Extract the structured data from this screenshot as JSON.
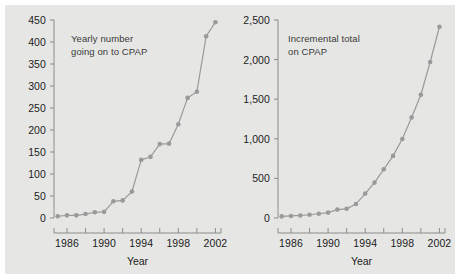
{
  "figure": {
    "background_color": "#e6e6e4",
    "border_color": "#ffffff",
    "series_color": "#9a9a9a",
    "axis_color": "#8c8c8c",
    "text_color": "#1c1c1c"
  },
  "chart_data": [
    {
      "type": "line",
      "title": "Yearly number\ngoing on to CPAP",
      "xlabel": "Year",
      "ylabel": "",
      "xlim": [
        1984.6,
        2002.6
      ],
      "ylim": [
        0,
        450
      ],
      "grid": false,
      "legend": "none",
      "marker": "circle",
      "ytick_labels": [
        "0",
        "50",
        "100",
        "150",
        "200",
        "250",
        "300",
        "350",
        "400",
        "450"
      ],
      "ytick_values": [
        0,
        50,
        100,
        150,
        200,
        250,
        300,
        350,
        400,
        450
      ],
      "xtick_values": [
        1986,
        1988,
        1990,
        1992,
        1994,
        1996,
        1998,
        2000,
        2002
      ],
      "xtick_labels": [
        "1986",
        "",
        "1990",
        "",
        "1994",
        "",
        "1998",
        "",
        "2002"
      ],
      "x": [
        1985,
        1986,
        1987,
        1988,
        1989,
        1990,
        1991,
        1992,
        1993,
        1994,
        1995,
        1996,
        1997,
        1998,
        1999,
        2000,
        2001,
        2002
      ],
      "values": [
        4,
        6,
        6,
        9,
        13,
        14,
        38,
        40,
        60,
        132,
        139,
        168,
        169,
        213,
        273,
        287,
        413,
        445
      ]
    },
    {
      "type": "line",
      "title": "Incremental total\non CPAP",
      "xlabel": "Year",
      "ylabel": "",
      "xlim": [
        1984.6,
        2002.6
      ],
      "ylim": [
        0,
        2500
      ],
      "grid": false,
      "legend": "none",
      "marker": "circle",
      "ytick_labels": [
        "0",
        "500",
        "1,000",
        "1,500",
        "2,000",
        "2,500"
      ],
      "ytick_values": [
        0,
        500,
        1000,
        1500,
        2000,
        2500
      ],
      "xtick_values": [
        1986,
        1988,
        1990,
        1992,
        1994,
        1996,
        1998,
        2000,
        2002
      ],
      "xtick_labels": [
        "1986",
        "",
        "1990",
        "",
        "1994",
        "",
        "1998",
        "",
        "2002"
      ],
      "x": [
        1985,
        1986,
        1987,
        1988,
        1989,
        1990,
        1991,
        1992,
        1993,
        1994,
        1995,
        1996,
        1997,
        1998,
        1999,
        2000,
        2001,
        2002
      ],
      "values": [
        20,
        26,
        32,
        41,
        54,
        68,
        106,
        116,
        176,
        308,
        447,
        615,
        784,
        997,
        1270,
        1557,
        1970,
        2415
      ]
    }
  ]
}
